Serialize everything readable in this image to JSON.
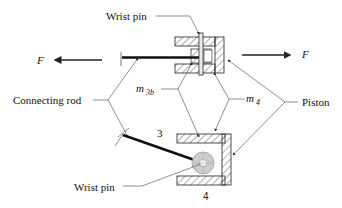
{
  "figure": {
    "labels": {
      "wrist_pin_top": "Wrist pin",
      "wrist_pin_bottom": "Wrist pin",
      "connecting_rod": "Connecting rod",
      "piston": "Piston",
      "force_left": "F",
      "force_right": "F",
      "mass_3b": "m",
      "mass_3b_sub": "3b",
      "mass_4": "m",
      "mass_4_sub": "4",
      "link_3": "3",
      "link_4": "4"
    },
    "colors": {
      "line": "#222222",
      "hatch": "#333333",
      "pin_fill": "#cccccc"
    }
  }
}
